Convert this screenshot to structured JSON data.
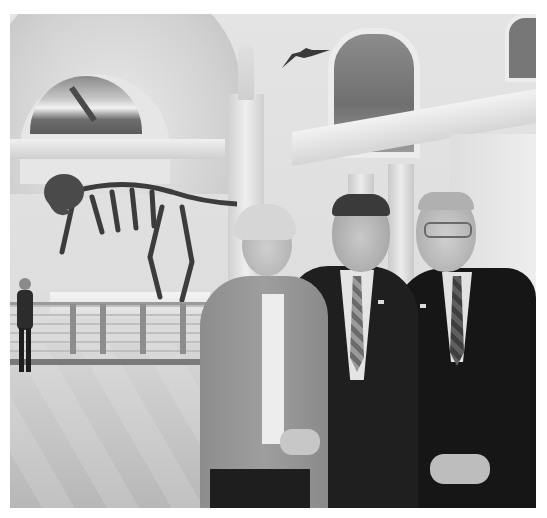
{
  "image": {
    "description": "Black-and-white photo of three people posing in a museum hall with a T. rex skeleton behind them",
    "subjects": [
      {
        "id": "woman",
        "clothing": "light jacket, white blouse, dark skirt",
        "position": "left"
      },
      {
        "id": "man-center",
        "clothing": "dark suit, plaid tie, lapel pin",
        "position": "center"
      },
      {
        "id": "man-right",
        "clothing": "dark suit, dark patterned tie, glasses, lapel pin",
        "position": "right"
      }
    ],
    "background": {
      "exhibit": "Tyrannosaurus rex skeleton on raised platform with railing",
      "ceiling_model": "pterosaur suspended from ceiling",
      "architecture": "arched vaults, columns, statue, mural lunette",
      "floor": "marble tiled floor"
    },
    "colors": {
      "border": "#ffffff",
      "wall": "#e0e0e0",
      "suit": "#1a1a1a",
      "jacket": "#959595",
      "floor": "#c4c4c4"
    }
  }
}
